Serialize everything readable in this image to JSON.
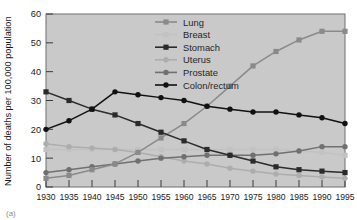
{
  "figure": {
    "background_color": "#ffffff",
    "plot_background_color": "#c9c9c9",
    "plot_border_color": "#6f6f6f",
    "caption": "(a)"
  },
  "axes": {
    "ylabel": "Number of deaths  per 100,000 population",
    "xlabel": "",
    "y_ticks": [
      "0",
      "10",
      "20",
      "30",
      "40",
      "50",
      "60"
    ],
    "x_ticks": [
      "1930",
      "1935",
      "1940",
      "1945",
      "1950",
      "1955",
      "1960",
      "1965",
      "1970",
      "1975",
      "1980",
      "1985",
      "1990",
      "1995"
    ]
  },
  "legend": {
    "position": "top-center-right",
    "entries": [
      {
        "label": "Lung",
        "color": "#8a8a8a",
        "marker": "square"
      },
      {
        "label": "Breast",
        "color": "#c2c2c2",
        "marker": "square"
      },
      {
        "label": "Stomach",
        "color": "#2b2b2b",
        "marker": "square"
      },
      {
        "label": "Uterus",
        "color": "#adadad",
        "marker": "circle"
      },
      {
        "label": "Prostate",
        "color": "#707070",
        "marker": "circle"
      },
      {
        "label": "Colon/rectum",
        "color": "#111111",
        "marker": "circle"
      }
    ]
  },
  "chart_data": {
    "type": "line",
    "title": "",
    "xlabel": "",
    "ylabel": "Number of deaths  per 100,000 population",
    "xlim": [
      1930,
      1995
    ],
    "ylim": [
      0,
      60
    ],
    "grid": false,
    "legend_position": "top-center-right",
    "x": [
      1930,
      1935,
      1940,
      1945,
      1950,
      1955,
      1960,
      1965,
      1970,
      1975,
      1980,
      1985,
      1990,
      1995
    ],
    "series": [
      {
        "name": "Lung",
        "color": "#8a8a8a",
        "marker": "square",
        "values": [
          3,
          4,
          6,
          8,
          12,
          17,
          22,
          28,
          35,
          42,
          47,
          51,
          54,
          54
        ]
      },
      {
        "name": "Breast",
        "color": "#c2c2c2",
        "marker": "square",
        "values": [
          13,
          13,
          13,
          13,
          13,
          13,
          13,
          13,
          13,
          13,
          13,
          12.5,
          12,
          11
        ]
      },
      {
        "name": "Stomach",
        "color": "#2b2b2b",
        "marker": "square",
        "values": [
          33,
          30,
          27,
          25,
          22,
          19,
          16,
          13,
          11,
          9,
          7,
          6,
          5.5,
          5
        ]
      },
      {
        "name": "Uterus",
        "color": "#adadad",
        "marker": "circle",
        "values": [
          15,
          14,
          13.5,
          13,
          12,
          10.5,
          9,
          8,
          6.5,
          5.5,
          4.5,
          4,
          3.5,
          3
        ]
      },
      {
        "name": "Prostate",
        "color": "#707070",
        "marker": "circle",
        "values": [
          5,
          6,
          7,
          8,
          9,
          10,
          10.5,
          11,
          11,
          11,
          11.5,
          12.5,
          14,
          14
        ]
      },
      {
        "name": "Colon/rectum",
        "color": "#111111",
        "marker": "circle",
        "values": [
          20,
          23,
          27,
          33,
          32,
          31,
          30,
          28,
          27,
          26,
          26,
          25,
          24,
          22
        ]
      }
    ]
  }
}
